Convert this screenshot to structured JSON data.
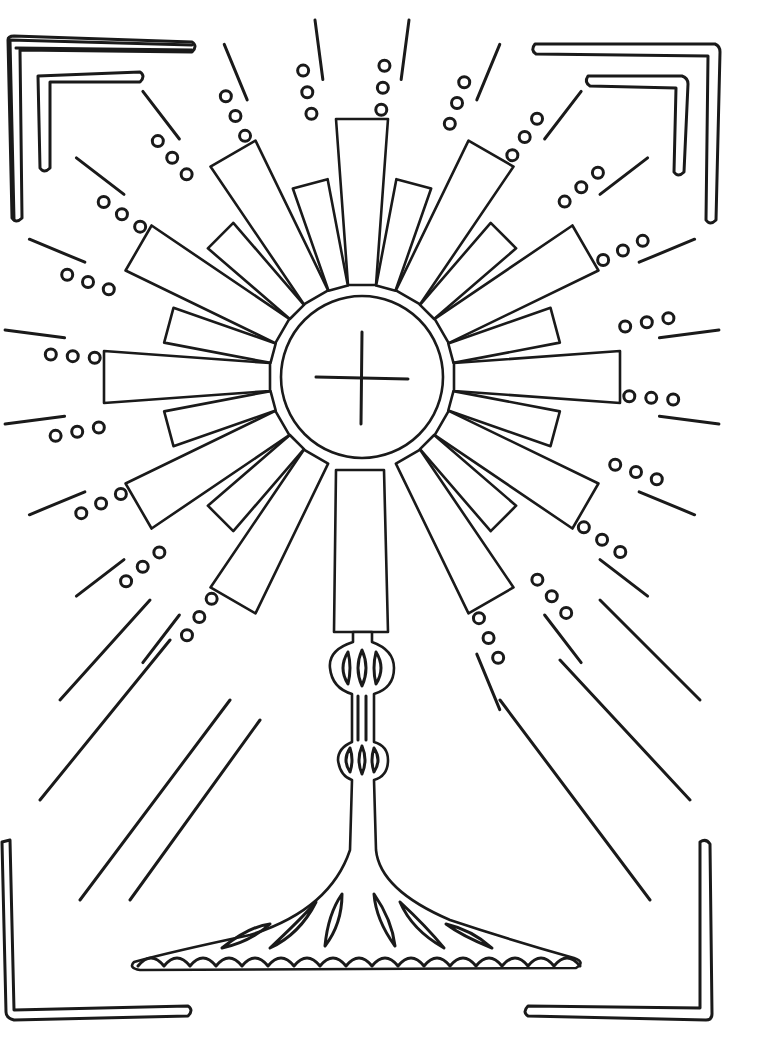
{
  "image": {
    "subject": "monstrance coloring page",
    "colors": {
      "ink": "#1a1a1a",
      "paper": "#ffffff"
    },
    "host": {
      "center": [
        362,
        377
      ],
      "radius": 81,
      "cross": true
    },
    "sunburst": {
      "ray_count": 24
    },
    "stem": {
      "knobs": 2
    },
    "base": {
      "petals": 6,
      "scallops": 17
    },
    "frame": {
      "corners": [
        "top-left",
        "top-right",
        "bottom-left",
        "bottom-right"
      ]
    }
  }
}
